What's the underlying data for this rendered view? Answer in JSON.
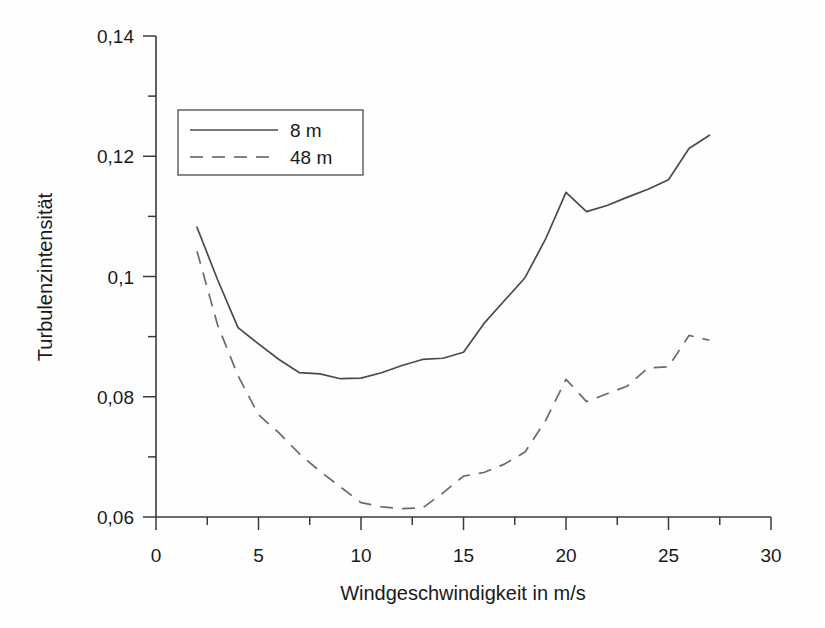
{
  "chart_data": {
    "type": "line",
    "title": "",
    "xlabel": "Windgeschwindigkeit in m/s",
    "ylabel": "Turbulenzintensität",
    "xlim": [
      0,
      30
    ],
    "ylim": [
      0.06,
      0.14
    ],
    "grid": false,
    "legend_position": "upper-left-inside",
    "x_ticks": [
      0,
      5,
      10,
      15,
      20,
      25,
      30
    ],
    "x_tick_labels": [
      "0",
      "5",
      "10",
      "15",
      "20",
      "25",
      "30"
    ],
    "x_minor_ticks": [
      2.5,
      7.5,
      12.5,
      17.5,
      22.5,
      27.5
    ],
    "y_ticks": [
      0.06,
      0.08,
      0.1,
      0.12,
      0.14
    ],
    "y_tick_labels": [
      "0,06",
      "0,08",
      "0,1",
      "0,12",
      "0,14"
    ],
    "y_minor_ticks": [
      0.07,
      0.09,
      0.11,
      0.13
    ],
    "x": [
      2,
      3,
      4,
      5,
      6,
      7,
      8,
      9,
      10,
      11,
      12,
      13,
      14,
      15,
      16,
      17,
      18,
      19,
      20,
      21,
      22,
      23,
      24,
      25,
      26,
      27
    ],
    "series": [
      {
        "name": "8 m",
        "style": "solid",
        "color": "#4a4a4a",
        "values": [
          0.1082,
          0.0995,
          0.0915,
          0.0888,
          0.0862,
          0.084,
          0.0838,
          0.083,
          0.0831,
          0.084,
          0.0852,
          0.0862,
          0.0864,
          0.0874,
          0.0922,
          0.096,
          0.0998,
          0.1062,
          0.114,
          0.1108,
          0.1118,
          0.1132,
          0.1145,
          0.1161,
          0.1213,
          0.1235
        ]
      },
      {
        "name": "48 m",
        "style": "dashed",
        "color": "#6a6a6a",
        "values": [
          0.1042,
          0.092,
          0.0835,
          0.077,
          0.074,
          0.0705,
          0.0676,
          0.065,
          0.0624,
          0.0617,
          0.0614,
          0.0615,
          0.064,
          0.0668,
          0.0674,
          0.0688,
          0.0708,
          0.076,
          0.0829,
          0.0792,
          0.0805,
          0.0818,
          0.0848,
          0.085,
          0.0902,
          0.0894
        ]
      }
    ],
    "legend": [
      {
        "label": "8 m",
        "style": "solid"
      },
      {
        "label": "48 m",
        "style": "dashed"
      }
    ]
  }
}
